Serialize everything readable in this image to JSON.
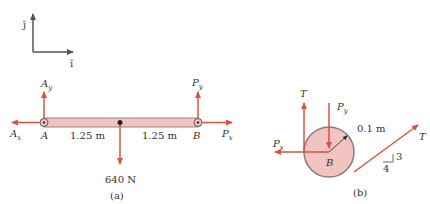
{
  "axes": {
    "j_label": "ĵ",
    "i_label": "î"
  },
  "figure_a": {
    "caption": "(a)",
    "point_A": "A",
    "point_B": "B",
    "dist_left": "1.25 m",
    "dist_right": "1.25 m",
    "load": "640 N",
    "Ay": {
      "main": "A",
      "sub": "y"
    },
    "Ax": {
      "main": "A",
      "sub": "x"
    },
    "Py": {
      "main": "P",
      "sub": "y"
    },
    "Px": {
      "main": "P",
      "sub": "x"
    }
  },
  "figure_b": {
    "caption": "(b)",
    "T_left": "T",
    "T_right": "T",
    "Py": {
      "main": "P",
      "sub": "y"
    },
    "Px": {
      "main": "P",
      "sub": "x"
    },
    "center": "B",
    "radius": "0.1 m",
    "slope_rise": "3",
    "slope_run": "4"
  },
  "colors": {
    "force": "#d9533f",
    "beam_fill": "#f2c4c1",
    "outline": "#8a7a7a",
    "axis": "#555555"
  }
}
